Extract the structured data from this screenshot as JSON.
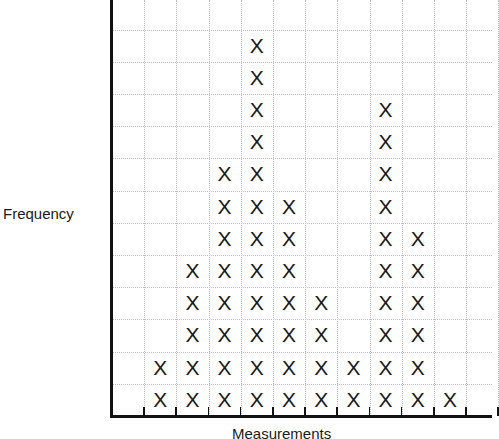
{
  "chart_data": {
    "type": "dot-plot",
    "title": "",
    "xlabel": "Measurements",
    "ylabel": "Frequency",
    "categories": [
      "1",
      "2",
      "3",
      "4",
      "5",
      "6",
      "7",
      "8",
      "9",
      "10"
    ],
    "values": [
      2,
      5,
      8,
      12,
      7,
      4,
      2,
      10,
      6,
      1
    ],
    "marker": "X",
    "grid": true,
    "grid_rows": 13,
    "grid_cols": 12,
    "tick_labels_shown": false
  },
  "labels": {
    "xlabel": "Measurements",
    "ylabel": "Frequency",
    "marker": "X"
  }
}
